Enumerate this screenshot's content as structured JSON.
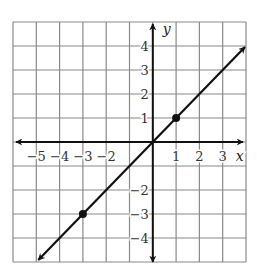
{
  "chart_data": {
    "type": "line",
    "title": "",
    "xlabel": "x",
    "ylabel": "y",
    "xlim": [
      -6,
      4
    ],
    "ylim": [
      -5,
      5
    ],
    "grid": true,
    "x_ticks": [
      {
        "value": -5,
        "label": "−5"
      },
      {
        "value": -4,
        "label": "−4"
      },
      {
        "value": -3,
        "label": "−3"
      },
      {
        "value": -2,
        "label": "−2"
      },
      {
        "value": 1,
        "label": "1"
      },
      {
        "value": 2,
        "label": "2"
      },
      {
        "value": 3,
        "label": "3"
      }
    ],
    "y_ticks": [
      {
        "value": 4,
        "label": "4"
      },
      {
        "value": 3,
        "label": "3"
      },
      {
        "value": 2,
        "label": "2"
      },
      {
        "value": 1,
        "label": "1"
      },
      {
        "value": -2,
        "label": "−2"
      },
      {
        "value": -3,
        "label": "−3"
      },
      {
        "value": -4,
        "label": "−4"
      }
    ],
    "series": [
      {
        "name": "y = x",
        "equation": "y = x",
        "slope": 1,
        "intercept": 0,
        "line_extent": {
          "x": [
            -5,
            4
          ],
          "y": [
            -5,
            4
          ]
        },
        "arrows_both_ends": true,
        "marked_points": [
          {
            "x": 1,
            "y": 1
          },
          {
            "x": -3,
            "y": -3
          }
        ]
      }
    ]
  },
  "colors": {
    "grid": "#8a8a8a",
    "axes": "#111111",
    "line": "#111111",
    "labels": "#333333"
  }
}
